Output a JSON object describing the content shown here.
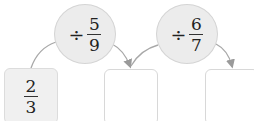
{
  "diagram": {
    "start": {
      "numerator": "2",
      "denominator": "3"
    },
    "operations": [
      {
        "symbol": "÷",
        "numerator": "5",
        "denominator": "9"
      },
      {
        "symbol": "÷",
        "numerator": "6",
        "denominator": "7"
      }
    ],
    "answers": [
      {
        "value": ""
      },
      {
        "value": ""
      }
    ],
    "colors": {
      "circle_fill": "#ececec",
      "box_fill": "#f0f0f0",
      "arrow": "#9a9a9a"
    }
  }
}
